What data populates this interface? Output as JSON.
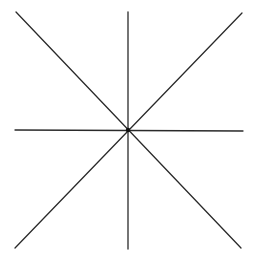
{
  "diagram": {
    "type": "radial-lines",
    "stroke_color": "#2a2a2a",
    "background": "#ffffff",
    "center": {
      "x": 128,
      "y": 130
    },
    "center_dot_radius": 2.2,
    "lines": [
      {
        "id": "vertical",
        "x1": 128,
        "y1": 12,
        "x2": 128,
        "y2": 249
      },
      {
        "id": "horizontal",
        "x1": 15,
        "y1": 130,
        "x2": 243,
        "y2": 131
      },
      {
        "id": "diagonal-down",
        "x1": 16,
        "y1": 12,
        "x2": 241,
        "y2": 248
      },
      {
        "id": "diagonal-up",
        "x1": 242,
        "y1": 13,
        "x2": 15,
        "y2": 248
      }
    ]
  }
}
